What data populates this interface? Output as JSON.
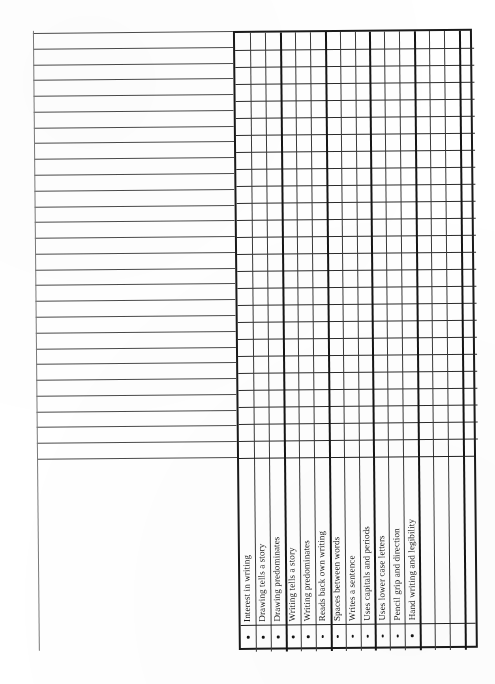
{
  "document": {
    "type": "assessment-checklist-grid",
    "title": "Writing Skills Assessment Checklist",
    "background_color": "#ffffff",
    "ink_color": "#1c1c1c"
  },
  "lined_area": {
    "name": "student-name-lines",
    "line_count": 28,
    "line_color": "#4a4a4a",
    "top": 33,
    "bottom": 459,
    "left": 33,
    "right": 233
  },
  "margin_rule": {
    "name": "left-margin-rule",
    "color": "#7a7a7a"
  },
  "grid": {
    "name": "assessment-grid",
    "border_color": "#1a1a1a",
    "column_count": 16,
    "row_count": 25,
    "major_column_every": 3,
    "left": 233,
    "top": 33,
    "right": 472,
    "bottom": 652
  },
  "columns": [
    {
      "index": 1,
      "label": "Interest in writing",
      "bullet": "•",
      "checked": false
    },
    {
      "index": 2,
      "label": "Drawing tells a story",
      "bullet": "•",
      "checked": false
    },
    {
      "index": 3,
      "label": "Drawing predominates",
      "bullet": "•",
      "checked": false
    },
    {
      "index": 4,
      "label": "Writing tells a story",
      "bullet": "•",
      "checked": false
    },
    {
      "index": 5,
      "label": "Writing predominates",
      "bullet": "•",
      "checked": false
    },
    {
      "index": 6,
      "label": "Reads back own writing",
      "bullet": "•",
      "checked": false
    },
    {
      "index": 7,
      "label": "Spaces between words",
      "bullet": "•",
      "checked": false
    },
    {
      "index": 8,
      "label": "Writes a sentence",
      "bullet": "•",
      "checked": false
    },
    {
      "index": 9,
      "label": "Uses capitals and periods",
      "bullet": "•",
      "checked": false
    },
    {
      "index": 10,
      "label": "Uses lower case letters",
      "bullet": "•",
      "checked": false
    },
    {
      "index": 11,
      "label": "Pencil grip and direction",
      "bullet": "•",
      "checked": false
    },
    {
      "index": 12,
      "label": "Hand writing and legibility",
      "bullet": "•",
      "checked": false
    },
    {
      "index": 13,
      "label": "",
      "bullet": "",
      "checked": false
    },
    {
      "index": 14,
      "label": "",
      "bullet": "",
      "checked": false
    },
    {
      "index": 15,
      "label": "",
      "bullet": "",
      "checked": false
    },
    {
      "index": 16,
      "label": "",
      "bullet": "",
      "checked": false
    }
  ]
}
